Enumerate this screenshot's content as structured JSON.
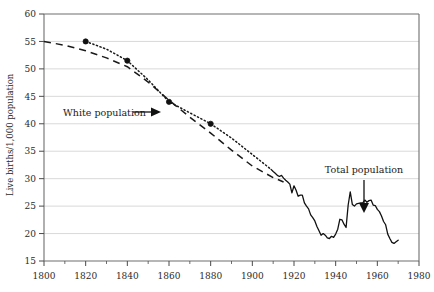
{
  "chart_data": {
    "type": "line",
    "title": "",
    "subtitle": "",
    "xlabel": "",
    "ylabel": "Live births/1,000 population",
    "xlim": [
      1800,
      1980
    ],
    "ylim": [
      15,
      60
    ],
    "xticks": [
      1800,
      1820,
      1840,
      1860,
      1880,
      1900,
      1920,
      1940,
      1960,
      1980
    ],
    "xtick_labels": [
      "1800",
      "1820",
      "1840",
      "1860",
      "1880",
      "1900",
      "1920",
      "1940",
      "1960",
      "1980"
    ],
    "yticks": [
      15,
      20,
      25,
      30,
      35,
      40,
      45,
      50,
      55,
      60
    ],
    "ytick_labels": [
      "15",
      "20",
      "25",
      "30",
      "35",
      "40",
      "45",
      "50",
      "55",
      "60"
    ],
    "grid": "horizontal",
    "legend_position": "none",
    "minor_xticks": true,
    "series": [
      {
        "name": "White population",
        "style": "dashed",
        "marker": "none",
        "x": [
          1800,
          1810,
          1820,
          1830,
          1840,
          1850,
          1860,
          1870,
          1880,
          1890,
          1900,
          1910,
          1915
        ],
        "values": [
          55.0,
          54.3,
          53.3,
          52.0,
          50.4,
          47.6,
          44.3,
          41.2,
          38.3,
          35.2,
          32.3,
          30.2,
          29.4
        ]
      },
      {
        "name": "Total population",
        "style": "dotted",
        "marker": "circle",
        "marker_x": [
          1820,
          1840,
          1860,
          1880
        ],
        "marker_values": [
          55.0,
          51.5,
          44.0,
          40.0
        ],
        "x": [
          1820,
          1830,
          1840,
          1850,
          1860,
          1870,
          1880,
          1890,
          1900,
          1909
        ],
        "values": [
          55.0,
          53.6,
          51.5,
          48.0,
          44.0,
          42.0,
          40.0,
          37.4,
          34.4,
          31.7
        ]
      },
      {
        "name": "Total population",
        "style": "solid",
        "marker": "none",
        "x": [
          1909,
          1910,
          1911,
          1912,
          1913,
          1914,
          1915,
          1916,
          1917,
          1918,
          1919,
          1920,
          1921,
          1922,
          1923,
          1924,
          1925,
          1926,
          1927,
          1928,
          1929,
          1930,
          1931,
          1932,
          1933,
          1934,
          1935,
          1936,
          1937,
          1938,
          1939,
          1940,
          1941,
          1942,
          1943,
          1944,
          1945,
          1946,
          1947,
          1948,
          1949,
          1950,
          1951,
          1952,
          1953,
          1954,
          1955,
          1956,
          1957,
          1958,
          1959,
          1960,
          1961,
          1962,
          1963,
          1964,
          1965,
          1966,
          1967,
          1968,
          1969,
          1970
        ],
        "values": [
          31.7,
          31.3,
          31.0,
          30.6,
          30.4,
          30.6,
          30.1,
          29.7,
          29.4,
          29.0,
          27.4,
          28.7,
          27.9,
          26.8,
          27.0,
          27.0,
          25.6,
          25.0,
          24.5,
          23.4,
          22.9,
          22.3,
          21.3,
          20.5,
          19.7,
          20.0,
          19.7,
          19.2,
          19.1,
          19.5,
          19.3,
          19.9,
          20.8,
          22.6,
          22.5,
          21.7,
          21.1,
          25.2,
          27.6,
          25.3,
          25.0,
          25.4,
          25.5,
          25.6,
          25.6,
          26.1,
          25.7,
          26.0,
          26.1,
          25.2,
          25.1,
          24.4,
          24.0,
          23.2,
          22.2,
          21.6,
          19.9,
          19.1,
          18.4,
          18.2,
          18.5,
          18.8
        ]
      }
    ],
    "annotations": [
      {
        "label": "White population",
        "arrow": "right",
        "x_pixel_label": 115,
        "y_pixel_label": 112
      },
      {
        "label": "Total population",
        "arrow": "down",
        "x_pixel_label": 364,
        "y_pixel_label": 170
      }
    ]
  }
}
